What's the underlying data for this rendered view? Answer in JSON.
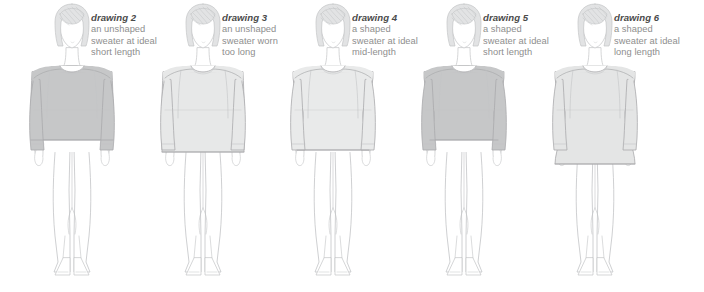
{
  "page": {
    "background_color": "#ffffff",
    "figure_count": 6
  },
  "palette": {
    "outline": "#a9aaac",
    "outline_soft": "#c3c4c6",
    "skin_fill": "#ffffff",
    "hair_fill": "#e2e3e4",
    "sweater_dark": "#c6c7c8",
    "sweater_light": "#e7e8e8",
    "sweater_mid": "#e1e2e2",
    "caption_title_color": "#4a4a4a",
    "caption_text_color": "#8e8e8e"
  },
  "figures": [
    {
      "id": "drawing-2",
      "title": "drawing 2",
      "lines": [
        "an unshaped",
        "sweater at ideal",
        "short length"
      ],
      "sweater_shade": "#c6c7c8",
      "sweater_style": "unshaped",
      "sweater_length": "short",
      "x": 8
    },
    {
      "id": "drawing-3",
      "title": "drawing 3",
      "lines": [
        "an unshaped",
        "sweater worn",
        "too long"
      ],
      "sweater_shade": "#e7e8e8",
      "sweater_style": "unshaped",
      "sweater_length": "too long",
      "x": 139
    },
    {
      "id": "drawing-4",
      "title": "drawing 4",
      "lines": [
        "a shaped",
        "sweater at ideal",
        "mid-length"
      ],
      "sweater_shade": "#e9eaea",
      "sweater_style": "shaped",
      "sweater_length": "mid-length",
      "x": 269
    },
    {
      "id": "drawing-5",
      "title": "drawing 5",
      "lines": [
        "a shaped",
        "sweater at ideal",
        "short length"
      ],
      "sweater_shade": "#c6c7c8",
      "sweater_style": "shaped",
      "sweater_length": "short",
      "x": 400
    },
    {
      "id": "drawing-6",
      "title": "drawing 6",
      "lines": [
        "a shaped",
        "sweater at ideal",
        "long length"
      ],
      "sweater_shade": "#e4e5e5",
      "sweater_style": "shaped",
      "sweater_length": "long",
      "x": 531
    }
  ]
}
